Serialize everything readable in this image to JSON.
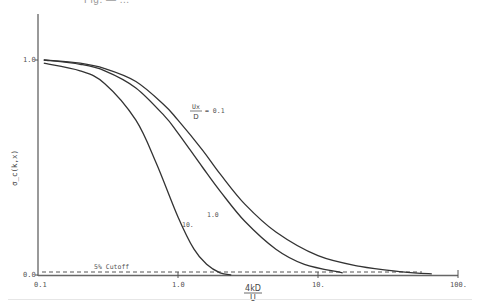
{
  "figure": {
    "title_fragment": "Fig. — ...",
    "ylabel": "σ_c(k,x)",
    "xlabel_num": "4kD",
    "xlabel_den": "U",
    "cutoff_label": "5% Cutoff",
    "legend_lhs_num": "Ux",
    "legend_lhs_den": "D",
    "legend_rhs": "= 0.1",
    "curve_labels": [
      "1.0",
      "10."
    ]
  },
  "chart_data": {
    "type": "line",
    "title": "",
    "xlabel": "4kD/U",
    "ylabel": "σ_c(k,x)",
    "xscale": "log",
    "xlim": [
      0.1,
      100
    ],
    "ylim": [
      0.0,
      1.0
    ],
    "xticks": [
      "0.1",
      "1.0",
      "10.",
      "100."
    ],
    "yticks": [
      "0.0",
      "1.0"
    ],
    "grid": false,
    "annotations": [
      {
        "text": "5% Cutoff",
        "type": "hline",
        "y": 0.015,
        "style": "dashed"
      },
      {
        "text": "Ux/D = 0.1",
        "series": "0.1"
      },
      {
        "text": "1.0",
        "series": "1.0"
      },
      {
        "text": "10.",
        "series": "10."
      }
    ],
    "series": [
      {
        "name": "0.1",
        "x": [
          0.11,
          0.2,
          0.3,
          0.5,
          0.8,
          1.0,
          1.5,
          2.0,
          3.0,
          5.0,
          10.0,
          20.0,
          40.0,
          65.0
        ],
        "y": [
          1.0,
          0.985,
          0.96,
          0.9,
          0.79,
          0.72,
          0.58,
          0.47,
          0.33,
          0.2,
          0.09,
          0.04,
          0.015,
          0.005
        ]
      },
      {
        "name": "1.0",
        "x": [
          0.11,
          0.2,
          0.3,
          0.5,
          0.8,
          1.0,
          1.5,
          2.0,
          3.0,
          5.0,
          8.0,
          15.0
        ],
        "y": [
          1.0,
          0.98,
          0.95,
          0.87,
          0.74,
          0.66,
          0.5,
          0.39,
          0.25,
          0.12,
          0.05,
          0.01
        ]
      },
      {
        "name": "10.",
        "x": [
          0.11,
          0.2,
          0.3,
          0.5,
          0.7,
          1.0,
          1.3,
          1.6,
          2.0,
          2.4
        ],
        "y": [
          0.985,
          0.95,
          0.89,
          0.72,
          0.52,
          0.27,
          0.12,
          0.05,
          0.01,
          0.0
        ]
      }
    ]
  }
}
